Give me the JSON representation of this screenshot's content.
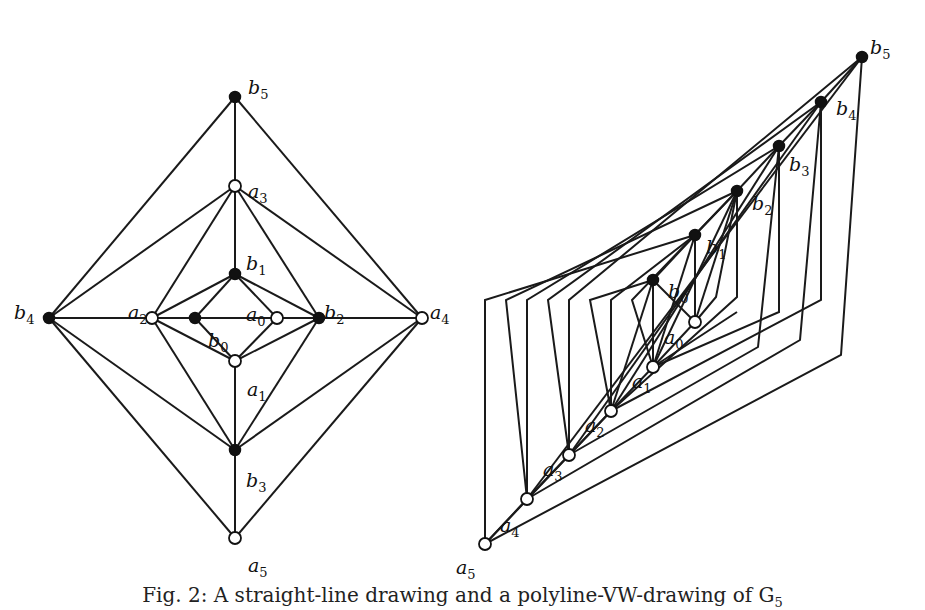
{
  "caption": "Fig. 2: A straight-line drawing and a polyline-VW-drawing of G",
  "caption_subscript": "5",
  "colors": {
    "stroke": "#1a1a1a",
    "filled_node": "#111111",
    "open_node": "#ffffff",
    "background": "#ffffff"
  },
  "left_drawing": {
    "title": "straight-line drawing",
    "nodes": [
      {
        "id": "b5",
        "base": "b",
        "sub": "5",
        "type": "filled",
        "x": 235,
        "y": 97,
        "lx": 248,
        "ly": 80
      },
      {
        "id": "a3",
        "base": "a",
        "sub": "3",
        "type": "open",
        "x": 235,
        "y": 186,
        "lx": 248,
        "ly": 184
      },
      {
        "id": "b1",
        "base": "b",
        "sub": "1",
        "type": "filled",
        "x": 235,
        "y": 274,
        "lx": 246,
        "ly": 256
      },
      {
        "id": "b4",
        "base": "b",
        "sub": "4",
        "type": "filled",
        "x": 49,
        "y": 318,
        "lx": 14,
        "ly": 305
      },
      {
        "id": "a2",
        "base": "a",
        "sub": "2",
        "type": "open",
        "x": 152,
        "y": 318,
        "lx": 128,
        "ly": 305
      },
      {
        "id": "b0",
        "base": "b",
        "sub": "0",
        "type": "filled",
        "x": 195,
        "y": 318,
        "lx": 208,
        "ly": 333
      },
      {
        "id": "a0",
        "base": "a",
        "sub": "0",
        "type": "open",
        "x": 277,
        "y": 318,
        "lx": 246,
        "ly": 307
      },
      {
        "id": "b2",
        "base": "b",
        "sub": "2",
        "type": "filled",
        "x": 319,
        "y": 318,
        "lx": 324,
        "ly": 305
      },
      {
        "id": "a4",
        "base": "a",
        "sub": "4",
        "type": "open",
        "x": 422,
        "y": 318,
        "lx": 430,
        "ly": 305
      },
      {
        "id": "a1",
        "base": "a",
        "sub": "1",
        "type": "open",
        "x": 235,
        "y": 361,
        "lx": 247,
        "ly": 382
      },
      {
        "id": "b3",
        "base": "b",
        "sub": "3",
        "type": "filled",
        "x": 235,
        "y": 450,
        "lx": 246,
        "ly": 473
      },
      {
        "id": "a5",
        "base": "a",
        "sub": "5",
        "type": "open",
        "x": 235,
        "y": 538,
        "lx": 248,
        "ly": 558
      }
    ],
    "edges": [
      [
        "b5",
        "a3"
      ],
      [
        "b5",
        "b4"
      ],
      [
        "b5",
        "a4"
      ],
      [
        "a3",
        "b4"
      ],
      [
        "a3",
        "a2"
      ],
      [
        "a3",
        "b1"
      ],
      [
        "a3",
        "b2"
      ],
      [
        "a3",
        "a4"
      ],
      [
        "b1",
        "a2"
      ],
      [
        "b1",
        "b0"
      ],
      [
        "b1",
        "a0"
      ],
      [
        "b1",
        "b2"
      ],
      [
        "b4",
        "a2"
      ],
      [
        "a2",
        "b0"
      ],
      [
        "b0",
        "a0"
      ],
      [
        "a0",
        "b2"
      ],
      [
        "b2",
        "a4"
      ],
      [
        "b0",
        "a1"
      ],
      [
        "a0",
        "a1"
      ],
      [
        "a2",
        "a1"
      ],
      [
        "b2",
        "a1"
      ],
      [
        "a1",
        "b3"
      ],
      [
        "a2",
        "b3"
      ],
      [
        "b2",
        "b3"
      ],
      [
        "b4",
        "b3"
      ],
      [
        "a4",
        "b3"
      ],
      [
        "b4",
        "a5"
      ],
      [
        "a4",
        "a5"
      ],
      [
        "b3",
        "a5"
      ]
    ]
  },
  "right_drawing": {
    "title": "polyline-VW-drawing",
    "nodes": [
      {
        "id": "b5",
        "base": "b",
        "sub": "5",
        "type": "filled",
        "x": 862,
        "y": 57,
        "lx": 870,
        "ly": 40
      },
      {
        "id": "b4",
        "base": "b",
        "sub": "4",
        "type": "filled",
        "x": 821,
        "y": 102,
        "lx": 836,
        "ly": 101
      },
      {
        "id": "b3",
        "base": "b",
        "sub": "3",
        "type": "filled",
        "x": 779,
        "y": 146,
        "lx": 789,
        "ly": 157
      },
      {
        "id": "b2",
        "base": "b",
        "sub": "2",
        "type": "filled",
        "x": 737,
        "y": 191,
        "lx": 752,
        "ly": 196
      },
      {
        "id": "b1",
        "base": "b",
        "sub": "1",
        "type": "filled",
        "x": 695,
        "y": 235,
        "lx": 706,
        "ly": 240
      },
      {
        "id": "b0",
        "base": "b",
        "sub": "0",
        "type": "filled",
        "x": 653,
        "y": 280,
        "lx": 668,
        "ly": 284
      },
      {
        "id": "a0",
        "base": "a",
        "sub": "0",
        "type": "open",
        "x": 695,
        "y": 322,
        "lx": 664,
        "ly": 330
      },
      {
        "id": "a1",
        "base": "a",
        "sub": "1",
        "type": "open",
        "x": 653,
        "y": 367,
        "lx": 632,
        "ly": 374
      },
      {
        "id": "a2",
        "base": "a",
        "sub": "2",
        "type": "open",
        "x": 611,
        "y": 411,
        "lx": 585,
        "ly": 418
      },
      {
        "id": "a3",
        "base": "a",
        "sub": "3",
        "type": "open",
        "x": 569,
        "y": 455,
        "lx": 543,
        "ly": 462
      },
      {
        "id": "a4",
        "base": "a",
        "sub": "4",
        "type": "open",
        "x": 527,
        "y": 499,
        "lx": 500,
        "ly": 518
      },
      {
        "id": "a5",
        "base": "a",
        "sub": "5",
        "type": "open",
        "x": 485,
        "y": 544,
        "lx": 456,
        "ly": 560
      }
    ],
    "polylines": [
      "653,280 653,367",
      "653,280 695,322",
      "653,280 611,411",
      "695,235 695,322",
      "695,235 653,280",
      "695,235 653,367",
      "737,191 695,235",
      "737,191 695,322",
      "737,191 653,367",
      "737,191 737,297 611,411",
      "779,146 737,191",
      "779,146 611,411",
      "779,146 779,312 653,367",
      "779,146 758,347 569,455",
      "821,102 779,146",
      "821,102 569,455",
      "821,102 821,300 611,411",
      "821,102 800,340 527,499",
      "862,57 821,102",
      "862,57 527,499",
      "862,57 841,355 485,544",
      "695,235 485,300 485,544",
      "737,191 506,300 527,499",
      "779,146 527,300 527,499",
      "821,102 548,300 569,455",
      "862,57 569,300 569,455",
      "653,280 590,300 611,411",
      "695,235 611,300 611,411",
      "737,191 632,300 653,367",
      "611,411 485,544",
      "653,367 611,411",
      "695,322 653,367",
      "611,411 569,455",
      "569,455 527,499",
      "527,499 485,544",
      "695,322 716,297 737,191",
      "653,367 737,312"
    ]
  }
}
